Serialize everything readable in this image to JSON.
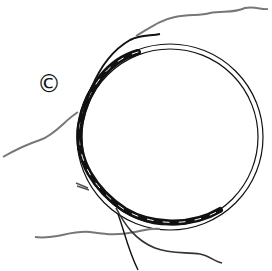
{
  "figure": {
    "label": "©",
    "colors": {
      "background": "#ffffff",
      "ink": "#111111",
      "wire_gray": "#777777"
    }
  }
}
